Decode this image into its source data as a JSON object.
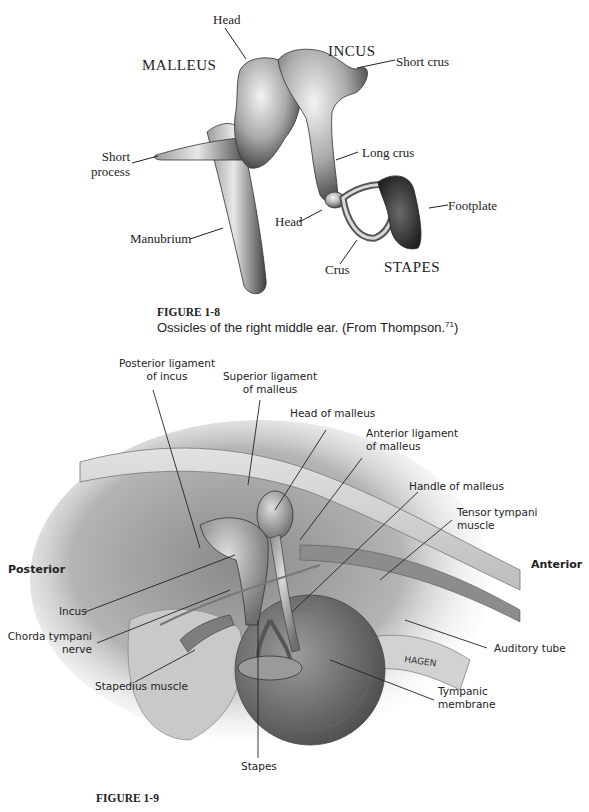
{
  "figure_1_8": {
    "labels": {
      "head_top": "Head",
      "malleus": "MALLEUS",
      "incus": "INCUS",
      "short_crus": "Short crus",
      "short_process_1": "Short",
      "short_process_2": "process",
      "long_crus": "Long crus",
      "footplate": "Footplate",
      "head_stapes": "Head",
      "manubrium": "Manubrium",
      "crus": "Crus",
      "stapes": "STAPES"
    },
    "caption": {
      "title": "FIGURE 1-8",
      "text": "Ossicles of the right middle ear. (From Thompson.",
      "ref": "71",
      "close": ")"
    }
  },
  "figure_1_9": {
    "labels": {
      "posterior_ligament_1": "Posterior ligament",
      "posterior_ligament_2": "of incus",
      "superior_ligament_1": "Superior ligament",
      "superior_ligament_2": "of malleus",
      "head_of_malleus": "Head of malleus",
      "anterior_ligament_1": "Anterior ligament",
      "anterior_ligament_2": "of malleus",
      "handle_of_malleus": "Handle of malleus",
      "tensor_tympani_1": "Tensor tympani",
      "tensor_tympani_2": "muscle",
      "posterior": "Posterior",
      "anterior": "Anterior",
      "incus": "Incus",
      "chorda_tympani_1": "Chorda tympani",
      "chorda_tympani_2": "nerve",
      "auditory_tube": "Auditory tube",
      "stapedius_muscle": "Stapedius muscle",
      "tympanic_membrane_1": "Tympanic",
      "tympanic_membrane_2": "membrane",
      "stapes": "Stapes",
      "signature": "HAGEN"
    },
    "caption": {
      "title": "FIGURE 1-9"
    }
  }
}
